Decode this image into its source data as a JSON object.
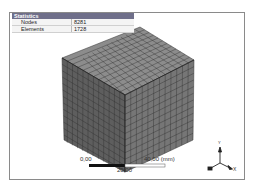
{
  "statistics": {
    "title": "Statistics",
    "rows": [
      {
        "label": "Nodes",
        "value": "8281"
      },
      {
        "label": "Elements",
        "value": "1728"
      }
    ]
  },
  "scale_bar": {
    "left_label": "0,00",
    "middle_label": "20,00",
    "right_label": "40,00 (mm)"
  },
  "triad": {
    "x_label": "X",
    "y_label": "Y",
    "z_label": "Z"
  },
  "colors": {
    "header_bg": "#6f6f8a",
    "mesh_top": "#8c8c8c",
    "mesh_left": "#5e5e5e",
    "mesh_right": "#767676",
    "mesh_lines": "#2a2a2a"
  }
}
